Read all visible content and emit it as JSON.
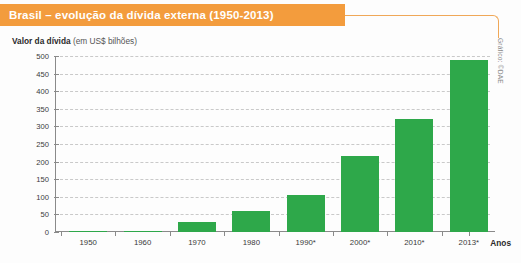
{
  "banner": {
    "title": "Brasil – evolução da dívida externa (1950-2013)"
  },
  "axis": {
    "y_label_bold": "Valor da dívida",
    "y_label_unit": "(em US$ bilhões)",
    "x_title": "Anos"
  },
  "credit": {
    "text": "Gráfico: ©DAE"
  },
  "colors": {
    "banner": "#f39c3d",
    "rule": "#f0a858",
    "bar": "#2ea84a",
    "grid": "#c9c9c9",
    "axis": "#8a8a8a",
    "text": "#3a3a3a"
  },
  "chart_data": {
    "type": "bar",
    "title": "Brasil – evolução da dívida externa (1950-2013)",
    "subtitle": "",
    "xlabel": "Anos",
    "ylabel": "Valor da dívida (em US$ bilhões)",
    "categories": [
      "1950",
      "1960",
      "1970",
      "1980",
      "1990*",
      "2000*",
      "2010*",
      "2013*"
    ],
    "values": [
      2,
      3,
      28,
      60,
      105,
      216,
      320,
      488
    ],
    "ylim": [
      0,
      500
    ],
    "yticks": [
      0,
      50,
      100,
      150,
      200,
      250,
      300,
      350,
      400,
      450,
      500
    ],
    "grid": true,
    "legend": "none",
    "series_color": "#2ea84a",
    "note": "Anos marcados com * indicam dados estimados/projetados"
  }
}
